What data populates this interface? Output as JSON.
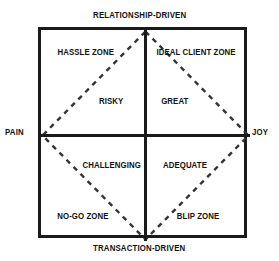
{
  "diagram": {
    "type": "2x2-matrix",
    "axes": {
      "top": "RELATIONSHIP-DRIVEN",
      "bottom": "TRANSACTION-DRIVEN",
      "left": "PAIN",
      "right": "JOY"
    },
    "zones": {
      "hassle": "HASSLE ZONE",
      "ideal": "IDEAL CLIENT ZONE",
      "risky": "RISKY",
      "great": "GREAT",
      "challenging": "CHALLENGING",
      "adequate": "ADEQUATE",
      "nogo": "NO-GO ZONE",
      "blip": "BLIP ZONE"
    },
    "colors": {
      "ink": "#1a1a1a",
      "background": "#ffffff",
      "dash": "#333333"
    }
  }
}
